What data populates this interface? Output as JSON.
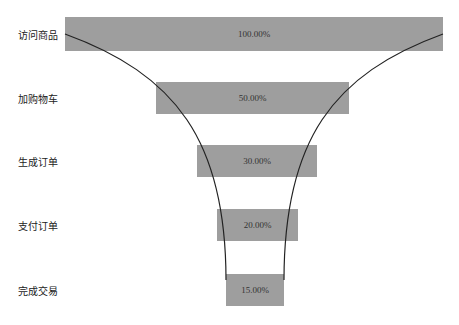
{
  "chart_data": {
    "type": "funnel",
    "title": "",
    "categories": [
      "访问商品",
      "加购物车",
      "生成订单",
      "支付订单",
      "完成交易"
    ],
    "values": [
      100.0,
      50.0,
      30.0,
      20.0,
      15.0
    ],
    "labels": [
      "100.00%",
      "50.00%",
      "30.00%",
      "20.00%",
      "15.00%"
    ],
    "unit": "%",
    "bar_color": "#9e9e9e",
    "curve_color": "#222222",
    "grid": false,
    "legend": "none"
  },
  "layout": {
    "bars": [
      {
        "x": 65,
        "y": 17,
        "w": 378,
        "h": 34
      },
      {
        "x": 156,
        "y": 82,
        "w": 193,
        "h": 32
      },
      {
        "x": 197,
        "y": 145,
        "w": 120,
        "h": 32
      },
      {
        "x": 217,
        "y": 209,
        "w": 81,
        "h": 32
      },
      {
        "x": 226,
        "y": 274,
        "w": 58,
        "h": 32
      }
    ]
  }
}
